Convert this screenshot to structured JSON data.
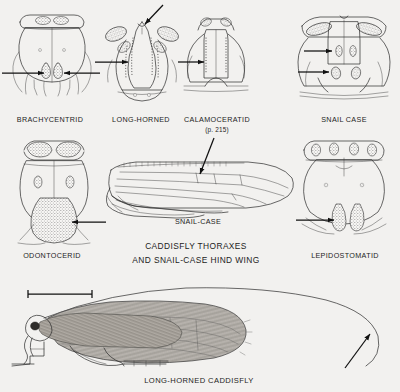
{
  "plate": {
    "title": "Caddisfly Thoraxes and Snail-Case Hind Wing",
    "background_color": "#f2f1ef",
    "ink_color": "#2a2a2a",
    "caption_color": "#232323"
  },
  "main_caption": {
    "line1": "CADDISFLY THORAXES",
    "line2": "AND SNAIL-CASE HIND WING"
  },
  "figures": [
    {
      "id": "brachycentrid",
      "label": "BRACHYCENTRID",
      "type": "thorax-dorsal",
      "row": 1,
      "pointers": [
        {
          "name": "left-arrow",
          "direction": "right"
        },
        {
          "name": "right-arrow",
          "direction": "left"
        }
      ]
    },
    {
      "id": "long-horned",
      "label": "LONG-HORNED",
      "type": "thorax-dorsal",
      "row": 1,
      "pointers": [
        {
          "name": "top-arrow",
          "direction": "down-left"
        },
        {
          "name": "left-arrow",
          "direction": "right"
        }
      ]
    },
    {
      "id": "calamoceratid",
      "label": "CALAMOCERATID",
      "sublabel": "(p. 215)",
      "type": "thorax-dorsal",
      "row": 1,
      "pointers": [
        {
          "name": "left-arrow",
          "direction": "right"
        }
      ]
    },
    {
      "id": "snail-case-thorax",
      "label": "SNAIL CASE",
      "type": "thorax-dorsal",
      "row": 1,
      "pointers": [
        {
          "name": "upper-arrow",
          "direction": "right"
        },
        {
          "name": "lower-arrow",
          "direction": "right"
        }
      ]
    },
    {
      "id": "odontocerid",
      "label": "ODONTOCERID",
      "type": "thorax-dorsal",
      "row": 2,
      "pointers": [
        {
          "name": "right-arrow",
          "direction": "left"
        }
      ]
    },
    {
      "id": "snail-case-wing",
      "label": "SNAIL-CASE",
      "type": "hind-wing",
      "row": 2,
      "pointers": [
        {
          "name": "leader-arrow",
          "direction": "down-left"
        }
      ]
    },
    {
      "id": "lepidostomatid",
      "label": "LEPIDOSTOMATID",
      "type": "thorax-dorsal",
      "row": 2,
      "pointers": [
        {
          "name": "left-arrow",
          "direction": "right"
        }
      ]
    },
    {
      "id": "long-horned-caddisfly",
      "label": "LONG-HORNED CADDISFLY",
      "type": "whole-insect-lateral",
      "row": 3,
      "pointers": [
        {
          "name": "antenna-arrow",
          "direction": "up-right"
        }
      ],
      "scale_bar": true
    }
  ]
}
